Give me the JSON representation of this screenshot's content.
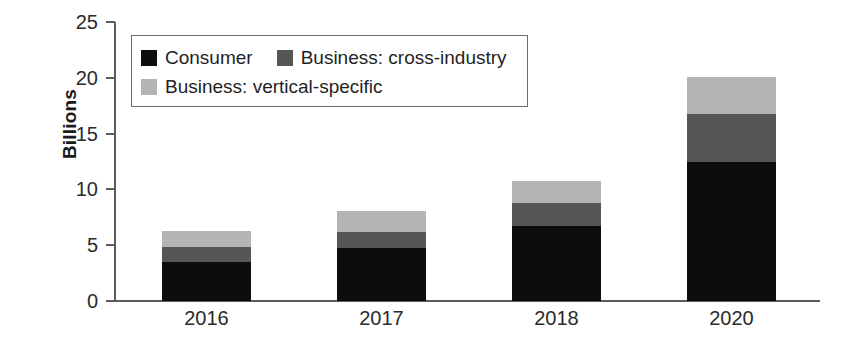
{
  "chart_data": {
    "type": "bar",
    "stacked": true,
    "title": "",
    "subtitle": "",
    "xlabel": "",
    "ylabel": "Billions",
    "categories": [
      "2016",
      "2017",
      "2018",
      "2020"
    ],
    "series": [
      {
        "name": "Consumer",
        "color": "#0d0d0d",
        "values": [
          3.5,
          4.75,
          6.7,
          12.5
        ]
      },
      {
        "name": "Business: cross-industry",
        "color": "#565656",
        "values": [
          1.3,
          1.45,
          2.1,
          4.3
        ]
      },
      {
        "name": "Business: vertical-specific",
        "color": "#b4b4b4",
        "values": [
          1.5,
          1.9,
          1.95,
          3.3
        ]
      }
    ],
    "totals": [
      6.3,
      8.1,
      10.75,
      20.1
    ],
    "ylim": [
      0,
      25
    ],
    "yticks": [
      0,
      5,
      10,
      15,
      20,
      25
    ],
    "ytick_labels": [
      "0",
      "5",
      "10",
      "15",
      "20",
      "25"
    ],
    "grid": false,
    "legend_position": "upper-left-inside"
  },
  "axis": {
    "y_title": "Billions",
    "y_tick_labels": [
      "25",
      "20",
      "15",
      "10",
      "5",
      "0"
    ],
    "x_tick_labels": [
      "2016",
      "2017",
      "2018",
      "2020"
    ]
  },
  "legend": {
    "items": [
      {
        "label": "Consumer",
        "color": "#0d0d0d"
      },
      {
        "label": "Business: cross-industry",
        "color": "#565656"
      },
      {
        "label": "Business: vertical-specific",
        "color": "#b4b4b4"
      }
    ]
  },
  "colors": {
    "consumer": "#0d0d0d",
    "cross_industry": "#565656",
    "vertical_specific": "#b4b4b4",
    "axis": "#5b5b5b",
    "text": "#2b2b2b",
    "background": "#ffffff"
  }
}
